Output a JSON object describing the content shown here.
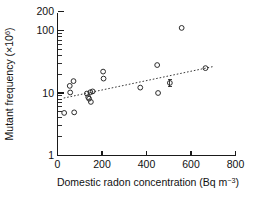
{
  "chart_data": {
    "type": "scatter",
    "title": "",
    "xlabel": "Domestic radon concentration (Bq m−3)",
    "xlabel_main": "Domestic radon concentration (Bq m",
    "xlabel_sup": "−3",
    "xlabel_tail": ")",
    "ylabel": "Mutant frequency (×10⁶)",
    "ylabel_main": "Mutant frequency (×10",
    "ylabel_sup": "6",
    "ylabel_tail": ")",
    "xscale": "linear",
    "yscale": "log",
    "xlim": [
      0,
      800
    ],
    "ylim": [
      1,
      250
    ],
    "grid": false,
    "legend": false,
    "legend_position": "none",
    "marker_style": "open-circle",
    "marker_color": "#2b2b2b",
    "trend_color": "#3a3a3a",
    "trend_style": "dotted",
    "xticks": [
      0,
      200,
      400,
      600,
      800
    ],
    "xticklabels": [
      "0",
      "200",
      "400",
      "600",
      "800"
    ],
    "yticks": [
      1,
      10,
      100,
      200
    ],
    "yticklabels": [
      "1",
      "10",
      "100",
      "200"
    ],
    "yminorticks": [
      2,
      3,
      4,
      5,
      6,
      7,
      8,
      9,
      20,
      30,
      40,
      50,
      60,
      70,
      80,
      90,
      200
    ],
    "points": [
      {
        "x": 30,
        "y": 4.8
      },
      {
        "x": 55,
        "y": 13.0
      },
      {
        "x": 57,
        "y": 10.2
      },
      {
        "x": 72,
        "y": 15.5
      },
      {
        "x": 75,
        "y": 4.9
      },
      {
        "x": 132,
        "y": 9.8
      },
      {
        "x": 138,
        "y": 8.6
      },
      {
        "x": 142,
        "y": 8.1
      },
      {
        "x": 148,
        "y": 10.3
      },
      {
        "x": 150,
        "y": 7.2
      },
      {
        "x": 158,
        "y": 10.6
      },
      {
        "x": 205,
        "y": 22.0
      },
      {
        "x": 207,
        "y": 17.0
      },
      {
        "x": 372,
        "y": 12.2
      },
      {
        "x": 448,
        "y": 28.0
      },
      {
        "x": 452,
        "y": 10.0
      },
      {
        "x": 505,
        "y": 14.5,
        "err_low": 12.6,
        "err_high": 16.6
      },
      {
        "x": 558,
        "y": 110.0
      },
      {
        "x": 665,
        "y": 25.0
      }
    ],
    "trendline": {
      "x0": 28,
      "y0": 8.3,
      "x1": 700,
      "y1": 26.5
    }
  }
}
